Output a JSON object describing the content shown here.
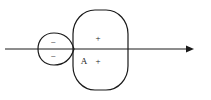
{
  "diagram": {
    "type": "orbital-lobes",
    "axis": {
      "direction": "right",
      "arrow": true
    },
    "small_lobe": {
      "signs": [
        "−",
        "−"
      ]
    },
    "large_lobe": {
      "signs": [
        "+",
        "+"
      ]
    },
    "label_A": "A",
    "colors": {
      "stroke": "#1a1a1a",
      "background": "#ffffff"
    }
  }
}
